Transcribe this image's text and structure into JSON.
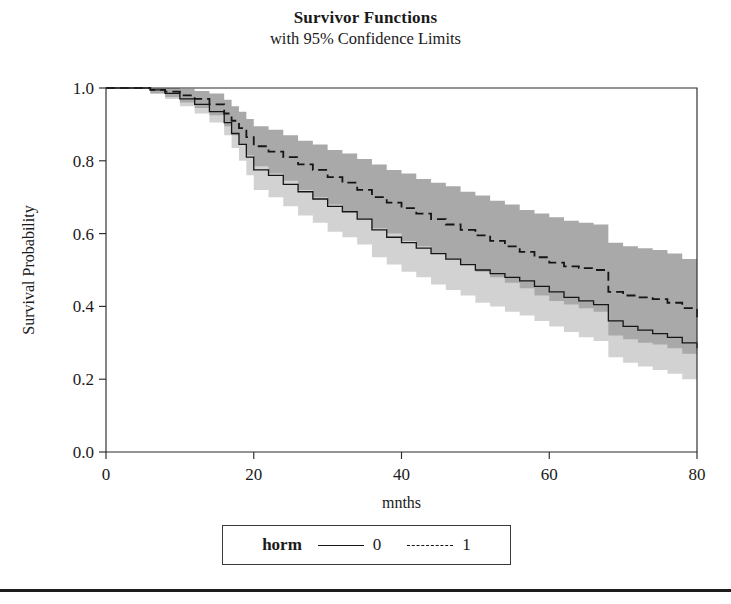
{
  "figure": {
    "title": "Survivor Functions",
    "subtitle": "with 95% Confidence Limits"
  },
  "legend": {
    "title": "horm",
    "entries": [
      {
        "label": "0",
        "style": "solid"
      },
      {
        "label": "1",
        "style": "dashed"
      }
    ]
  },
  "axes": {
    "x_title": "mnths",
    "y_title": "Survival Probability",
    "x_ticks": [
      "0",
      "20",
      "40",
      "60",
      "80"
    ],
    "y_ticks": [
      "0.0",
      "0.2",
      "0.4",
      "0.6",
      "0.8",
      "1.0"
    ]
  },
  "chart_data": {
    "type": "line",
    "title": "Survivor Functions",
    "subtitle": "with 95% Confidence Limits",
    "xlabel": "mnths",
    "ylabel": "Survival Probability",
    "xlim": [
      0,
      80
    ],
    "ylim": [
      0.0,
      1.0
    ],
    "xticks": [
      0,
      20,
      40,
      60,
      80
    ],
    "yticks": [
      0.0,
      0.2,
      0.4,
      0.6,
      0.8,
      1.0
    ],
    "grid": false,
    "legend_position": "below-axes",
    "legend_title": "horm",
    "confidence_level": 0.95,
    "band_colors": {
      "horm_0": "#d2d2d2",
      "horm_1": "#a9a9a9"
    },
    "line_colors": {
      "horm_0": "#151515",
      "horm_1": "#151515"
    },
    "line_styles": {
      "horm_0": "solid",
      "horm_1": "dashed"
    },
    "series": [
      {
        "name": "0",
        "style": "solid",
        "x": [
          0,
          4,
          6,
          8,
          10,
          12,
          14,
          16,
          17,
          18,
          19,
          20,
          22,
          24,
          26,
          28,
          30,
          32,
          34,
          36,
          38,
          40,
          42,
          44,
          46,
          48,
          50,
          52,
          54,
          56,
          58,
          60,
          62,
          64,
          66,
          68,
          70,
          72,
          74,
          76,
          78,
          80
        ],
        "y": [
          1.0,
          1.0,
          0.995,
          0.985,
          0.97,
          0.955,
          0.935,
          0.905,
          0.875,
          0.845,
          0.81,
          0.775,
          0.76,
          0.735,
          0.715,
          0.695,
          0.675,
          0.66,
          0.64,
          0.61,
          0.59,
          0.575,
          0.56,
          0.545,
          0.53,
          0.515,
          0.5,
          0.49,
          0.48,
          0.47,
          0.455,
          0.44,
          0.425,
          0.415,
          0.405,
          0.36,
          0.345,
          0.335,
          0.325,
          0.315,
          0.3,
          0.285
        ],
        "lower": [
          1.0,
          1.0,
          0.985,
          0.97,
          0.95,
          0.93,
          0.905,
          0.87,
          0.835,
          0.8,
          0.76,
          0.72,
          0.7,
          0.675,
          0.65,
          0.63,
          0.605,
          0.59,
          0.57,
          0.535,
          0.515,
          0.495,
          0.48,
          0.46,
          0.445,
          0.43,
          0.41,
          0.4,
          0.385,
          0.375,
          0.36,
          0.345,
          0.33,
          0.315,
          0.305,
          0.26,
          0.245,
          0.235,
          0.225,
          0.215,
          0.2,
          0.18
        ],
        "upper": [
          1.0,
          1.0,
          1.0,
          0.998,
          0.99,
          0.98,
          0.965,
          0.94,
          0.915,
          0.89,
          0.86,
          0.83,
          0.815,
          0.795,
          0.775,
          0.76,
          0.74,
          0.725,
          0.71,
          0.685,
          0.665,
          0.65,
          0.635,
          0.625,
          0.61,
          0.6,
          0.585,
          0.575,
          0.565,
          0.555,
          0.545,
          0.53,
          0.52,
          0.51,
          0.5,
          0.46,
          0.445,
          0.435,
          0.425,
          0.415,
          0.4,
          0.39
        ]
      },
      {
        "name": "1",
        "style": "dashed",
        "x": [
          0,
          4,
          6,
          8,
          10,
          12,
          14,
          16,
          17,
          18,
          19,
          20,
          22,
          24,
          26,
          28,
          30,
          32,
          34,
          36,
          38,
          40,
          42,
          44,
          46,
          48,
          50,
          52,
          54,
          56,
          58,
          60,
          62,
          64,
          66,
          68,
          70,
          72,
          74,
          76,
          78,
          80
        ],
        "y": [
          1.0,
          1.0,
          0.995,
          0.99,
          0.98,
          0.97,
          0.955,
          0.93,
          0.91,
          0.89,
          0.865,
          0.84,
          0.825,
          0.81,
          0.79,
          0.775,
          0.755,
          0.74,
          0.72,
          0.7,
          0.685,
          0.67,
          0.655,
          0.64,
          0.625,
          0.61,
          0.595,
          0.58,
          0.565,
          0.55,
          0.535,
          0.52,
          0.51,
          0.505,
          0.5,
          0.44,
          0.43,
          0.425,
          0.42,
          0.41,
          0.395,
          0.37
        ],
        "lower": [
          1.0,
          1.0,
          0.985,
          0.975,
          0.96,
          0.945,
          0.925,
          0.895,
          0.87,
          0.845,
          0.815,
          0.785,
          0.765,
          0.745,
          0.72,
          0.7,
          0.68,
          0.66,
          0.64,
          0.615,
          0.6,
          0.58,
          0.565,
          0.545,
          0.53,
          0.515,
          0.495,
          0.48,
          0.465,
          0.45,
          0.43,
          0.415,
          0.405,
          0.395,
          0.385,
          0.32,
          0.31,
          0.3,
          0.295,
          0.285,
          0.27,
          0.24
        ],
        "upper": [
          1.0,
          1.0,
          1.0,
          1.0,
          0.998,
          0.992,
          0.985,
          0.968,
          0.95,
          0.935,
          0.915,
          0.895,
          0.885,
          0.87,
          0.855,
          0.845,
          0.83,
          0.82,
          0.805,
          0.79,
          0.775,
          0.765,
          0.75,
          0.74,
          0.73,
          0.715,
          0.705,
          0.69,
          0.68,
          0.665,
          0.655,
          0.645,
          0.635,
          0.63,
          0.625,
          0.575,
          0.565,
          0.56,
          0.555,
          0.545,
          0.53,
          0.51
        ]
      }
    ]
  }
}
